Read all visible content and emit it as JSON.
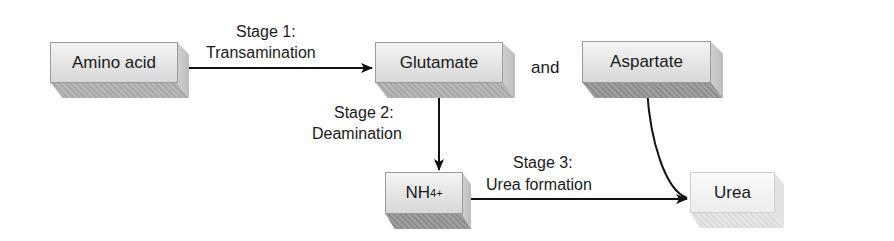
{
  "diagram": {
    "nodes": {
      "amino_acid": "Amino acid",
      "glutamate": "Glutamate",
      "and": "and",
      "aspartate": "Aspartate",
      "ammonium_base": "NH",
      "ammonium_sub": "4",
      "ammonium_sup": "+",
      "urea": "Urea"
    },
    "stages": {
      "stage1_title": "Stage 1:",
      "stage1_name": "Transamination",
      "stage2_title": "Stage 2:",
      "stage2_name": "Deamination",
      "stage3_title": "Stage 3:",
      "stage3_name": "Urea formation"
    },
    "edges": [
      {
        "from": "Amino acid",
        "to": "Glutamate",
        "label": "Stage 1: Transamination"
      },
      {
        "from": "Glutamate",
        "to": "NH4+",
        "label": "Stage 2: Deamination"
      },
      {
        "from": "NH4+",
        "to": "Urea",
        "label": "Stage 3: Urea formation"
      },
      {
        "from": "Aspartate",
        "to": "Urea",
        "label": ""
      }
    ]
  }
}
